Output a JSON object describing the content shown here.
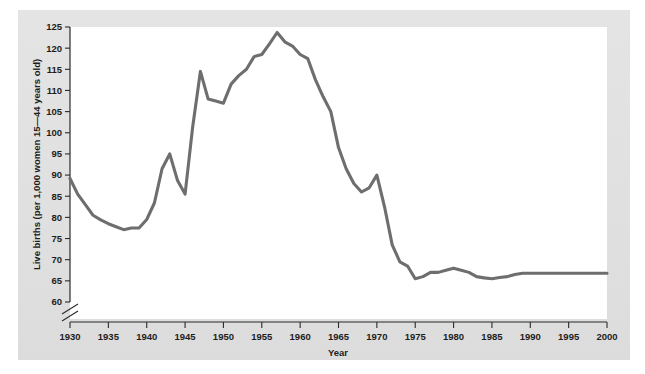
{
  "figure": {
    "background_color": "#e2e2e2",
    "plot_background_color": "#ffffff",
    "line_color": "#6e6e6e",
    "axis_color": "#2a2a2a"
  },
  "axes": {
    "y_title": "Live births (per 1,000 women 15—44 years old)",
    "x_title": "Year",
    "y_ticks": [
      "60",
      "65",
      "70",
      "75",
      "80",
      "85",
      "90",
      "95",
      "100",
      "105",
      "110",
      "115",
      "120",
      "125"
    ],
    "x_ticks": [
      "1930",
      "1935",
      "1940",
      "1945",
      "1950",
      "1955",
      "1960",
      "1965",
      "1970",
      "1975",
      "1980",
      "1985",
      "1990",
      "1995",
      "2000"
    ],
    "y_axis_break": "axis-break-slash"
  },
  "chart_data": {
    "type": "line",
    "title": "",
    "subtitle": "",
    "xlabel": "Year",
    "ylabel": "Live births (per 1,000 women 15—44 years old)",
    "xlim": [
      1930,
      2000
    ],
    "ylim": [
      60,
      125
    ],
    "grid": false,
    "legend": null,
    "axis_break_y": true,
    "series": [
      {
        "name": "Live birth rate",
        "color": "#6e6e6e",
        "x": [
          1930,
          1931,
          1932,
          1933,
          1934,
          1935,
          1936,
          1937,
          1938,
          1939,
          1940,
          1941,
          1942,
          1943,
          1944,
          1945,
          1946,
          1947,
          1948,
          1949,
          1950,
          1951,
          1952,
          1953,
          1954,
          1955,
          1956,
          1957,
          1958,
          1959,
          1960,
          1961,
          1962,
          1963,
          1964,
          1965,
          1966,
          1967,
          1968,
          1969,
          1970,
          1971,
          1972,
          1973,
          1974,
          1975,
          1976,
          1977,
          1978,
          1979,
          1980,
          1981,
          1982,
          1983,
          1984,
          1985,
          1986,
          1987,
          1988,
          1989,
          1990,
          1991,
          1992,
          1993,
          1994,
          1995,
          1996,
          1997,
          1998,
          1999,
          2000
        ],
        "y": [
          89.2,
          85.5,
          83.0,
          80.5,
          79.4,
          78.5,
          77.8,
          77.1,
          77.5,
          77.5,
          79.5,
          83.4,
          91.5,
          95.0,
          88.8,
          85.5,
          101.5,
          114.5,
          108.0,
          107.5,
          107.0,
          111.5,
          113.5,
          115.0,
          118.0,
          118.5,
          121.0,
          123.7,
          121.5,
          120.5,
          118.5,
          117.5,
          112.5,
          108.5,
          105.0,
          96.5,
          91.5,
          88.0,
          86.0,
          87.0,
          90.0,
          82.5,
          73.5,
          69.5,
          68.5,
          65.5,
          66.0,
          67.0,
          67.0,
          67.5,
          68.0,
          67.5,
          67.0,
          66.0,
          65.7,
          65.5,
          65.8,
          66.0,
          66.5,
          66.8,
          66.8,
          66.8,
          66.8,
          66.8,
          66.8,
          66.8,
          66.8,
          66.8,
          66.8,
          66.8,
          66.8
        ]
      }
    ]
  }
}
